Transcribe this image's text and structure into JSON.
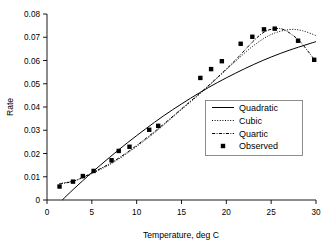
{
  "chart_data": {
    "type": "scatter",
    "title": "",
    "xlabel": "Temperature, deg C",
    "ylabel": "Rate",
    "xlim": [
      0,
      30
    ],
    "ylim": [
      0,
      0.08
    ],
    "xticks": [
      0,
      5,
      10,
      15,
      20,
      25,
      30
    ],
    "xtick_labels": [
      "0",
      "5",
      "10",
      "15",
      "20",
      "25",
      "30"
    ],
    "yticks": [
      0,
      0.01,
      0.02,
      0.03,
      0.04,
      0.05,
      0.06,
      0.07,
      0.08
    ],
    "ytick_labels": [
      "0",
      "0.01",
      "0.02",
      "0.03",
      "0.04",
      "0.05",
      "0.06",
      "0.07",
      "0.08"
    ],
    "grid": false,
    "legend_position": "center-right",
    "legend_entries": [
      {
        "label": "Quadratic",
        "style": "solid"
      },
      {
        "label": "Cubic",
        "style": "dotted"
      },
      {
        "label": "Quartic",
        "style": "dash-dot"
      },
      {
        "label": "Observed",
        "style": "square-marker"
      }
    ],
    "series": [
      {
        "name": "Observed",
        "type": "scatter",
        "marker": "square",
        "points": [
          {
            "x": 1.4,
            "y": 0.0058
          },
          {
            "x": 2.9,
            "y": 0.0079
          },
          {
            "x": 4.0,
            "y": 0.0103
          },
          {
            "x": 5.2,
            "y": 0.0125
          },
          {
            "x": 7.2,
            "y": 0.0171
          },
          {
            "x": 8.0,
            "y": 0.0211
          },
          {
            "x": 9.2,
            "y": 0.0229
          },
          {
            "x": 11.4,
            "y": 0.0302
          },
          {
            "x": 12.4,
            "y": 0.0319
          },
          {
            "x": 17.1,
            "y": 0.0525
          },
          {
            "x": 18.3,
            "y": 0.0563
          },
          {
            "x": 19.5,
            "y": 0.0597
          },
          {
            "x": 21.6,
            "y": 0.0672
          },
          {
            "x": 22.9,
            "y": 0.0702
          },
          {
            "x": 24.2,
            "y": 0.0734
          },
          {
            "x": 25.4,
            "y": 0.0737
          },
          {
            "x": 28.0,
            "y": 0.0685
          },
          {
            "x": 29.8,
            "y": 0.0603
          }
        ]
      },
      {
        "name": "Quadratic",
        "type": "line",
        "style": "solid",
        "points": [
          {
            "x": 1.7,
            "y": 0.0
          },
          {
            "x": 3.0,
            "y": 0.0048
          },
          {
            "x": 5.0,
            "y": 0.0118
          },
          {
            "x": 7.0,
            "y": 0.0184
          },
          {
            "x": 9.0,
            "y": 0.0247
          },
          {
            "x": 11.0,
            "y": 0.0306
          },
          {
            "x": 13.0,
            "y": 0.0362
          },
          {
            "x": 15.0,
            "y": 0.0413
          },
          {
            "x": 17.0,
            "y": 0.0461
          },
          {
            "x": 19.0,
            "y": 0.0505
          },
          {
            "x": 21.0,
            "y": 0.0545
          },
          {
            "x": 23.0,
            "y": 0.0582
          },
          {
            "x": 25.0,
            "y": 0.0615
          },
          {
            "x": 27.0,
            "y": 0.0644
          },
          {
            "x": 29.0,
            "y": 0.0669
          },
          {
            "x": 30.0,
            "y": 0.0681
          }
        ]
      },
      {
        "name": "Cubic",
        "type": "line",
        "style": "dotted",
        "points": [
          {
            "x": 1.4,
            "y": 0.0071
          },
          {
            "x": 2.9,
            "y": 0.0081
          },
          {
            "x": 4.0,
            "y": 0.0096
          },
          {
            "x": 5.2,
            "y": 0.0117
          },
          {
            "x": 7.2,
            "y": 0.0157
          },
          {
            "x": 9.2,
            "y": 0.0208
          },
          {
            "x": 11.4,
            "y": 0.0271
          },
          {
            "x": 13.0,
            "y": 0.0322
          },
          {
            "x": 15.0,
            "y": 0.0389
          },
          {
            "x": 17.1,
            "y": 0.0458
          },
          {
            "x": 19.0,
            "y": 0.0525
          },
          {
            "x": 21.0,
            "y": 0.0596
          },
          {
            "x": 23.0,
            "y": 0.0663
          },
          {
            "x": 25.0,
            "y": 0.0712
          },
          {
            "x": 27.0,
            "y": 0.0733
          },
          {
            "x": 28.5,
            "y": 0.0728
          },
          {
            "x": 30.0,
            "y": 0.0707
          }
        ]
      },
      {
        "name": "Quartic",
        "type": "line",
        "style": "dash-dot",
        "points": [
          {
            "x": 1.4,
            "y": 0.0069
          },
          {
            "x": 2.9,
            "y": 0.008
          },
          {
            "x": 4.0,
            "y": 0.0098
          },
          {
            "x": 5.2,
            "y": 0.012
          },
          {
            "x": 7.2,
            "y": 0.0161
          },
          {
            "x": 9.2,
            "y": 0.0212
          },
          {
            "x": 11.4,
            "y": 0.0276
          },
          {
            "x": 13.0,
            "y": 0.0326
          },
          {
            "x": 15.0,
            "y": 0.0392
          },
          {
            "x": 17.1,
            "y": 0.0461
          },
          {
            "x": 19.0,
            "y": 0.0527
          },
          {
            "x": 21.0,
            "y": 0.0601
          },
          {
            "x": 22.9,
            "y": 0.0679
          },
          {
            "x": 24.2,
            "y": 0.0722
          },
          {
            "x": 25.4,
            "y": 0.0737
          },
          {
            "x": 26.5,
            "y": 0.0731
          },
          {
            "x": 28.0,
            "y": 0.069
          },
          {
            "x": 29.0,
            "y": 0.0645
          },
          {
            "x": 29.8,
            "y": 0.0605
          }
        ]
      }
    ]
  }
}
